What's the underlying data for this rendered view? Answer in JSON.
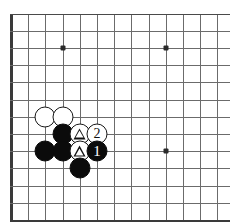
{
  "diagram": {
    "kind": "go-board-diagram",
    "title": "",
    "board": {
      "cell_size": 17.2,
      "origin_x": 11,
      "origin_y": 13.5,
      "cols": 13,
      "rows": 12,
      "line_color": "#6b6b6b",
      "edge_color": "#3a3a3a",
      "background": "#ffffff",
      "left_edge_thick": true,
      "bottom_edge_thick": true,
      "top_edge_thick": false,
      "right_edge_visible": false
    },
    "star_points": [
      {
        "col": 3,
        "row": 2
      },
      {
        "col": 9,
        "row": 2
      },
      {
        "col": 9,
        "row": 8
      }
    ],
    "stones": [
      {
        "id": "w-c2r6",
        "color": "white",
        "col": 2,
        "row": 6,
        "mark": "none",
        "label": ""
      },
      {
        "id": "w-c3r6",
        "color": "white",
        "col": 3,
        "row": 6,
        "mark": "none",
        "label": ""
      },
      {
        "id": "b-c3r7",
        "color": "black",
        "col": 3,
        "row": 7,
        "mark": "none",
        "label": ""
      },
      {
        "id": "w-c4r7",
        "color": "white",
        "col": 4,
        "row": 7,
        "mark": "triangle",
        "label": ""
      },
      {
        "id": "w-c5r7",
        "color": "white",
        "col": 5,
        "row": 7,
        "mark": "number",
        "label": "2"
      },
      {
        "id": "b-c2r8",
        "color": "black",
        "col": 2,
        "row": 8,
        "mark": "none",
        "label": ""
      },
      {
        "id": "b-c3r8",
        "color": "black",
        "col": 3,
        "row": 8,
        "mark": "none",
        "label": ""
      },
      {
        "id": "w-c4r8",
        "color": "white",
        "col": 4,
        "row": 8,
        "mark": "triangle",
        "label": ""
      },
      {
        "id": "b-c5r8",
        "color": "black",
        "col": 5,
        "row": 8,
        "mark": "number",
        "label": "1"
      },
      {
        "id": "b-c4r9",
        "color": "black",
        "col": 4,
        "row": 9,
        "mark": "none",
        "label": ""
      }
    ],
    "move_labels": [
      "1",
      "2"
    ],
    "colors": {
      "black_stone": "#0b0b0b",
      "white_stone": "#ffffff",
      "stone_outline": "#171717",
      "grid": "#6b6b6b",
      "border": "#3a3a3a"
    }
  }
}
